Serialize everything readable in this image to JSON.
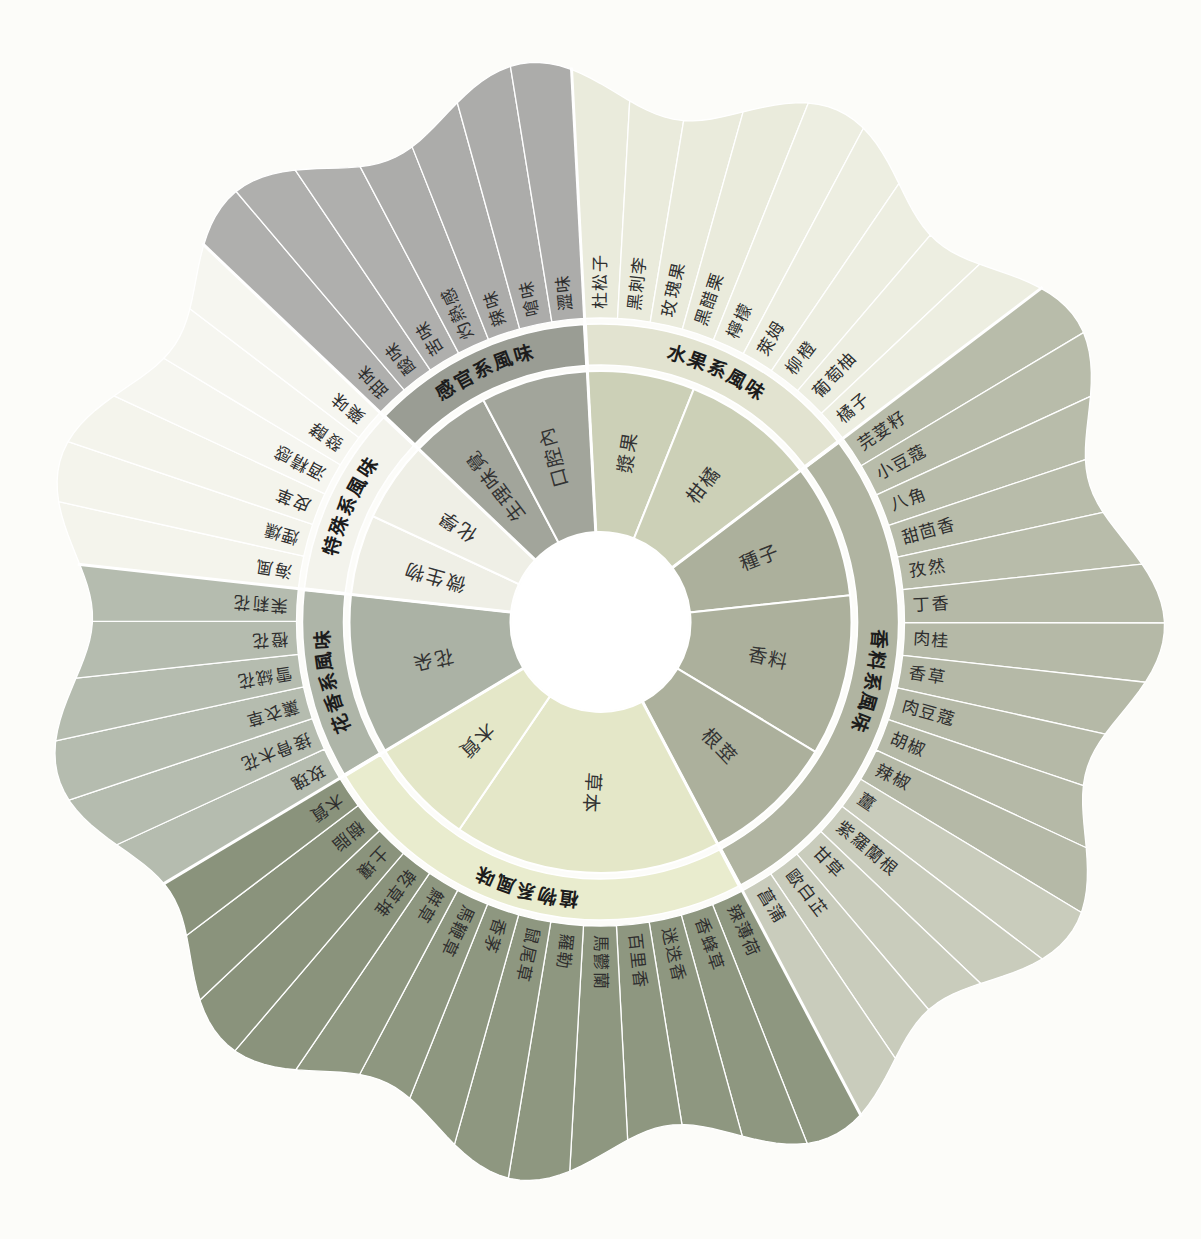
{
  "chart_data": {
    "type": "sunburst",
    "title": "",
    "legend": "none",
    "grid": false,
    "rings": 3,
    "sections": [
      {
        "label": "水果系風味",
        "band_color": "#e2e3d0",
        "inner_color": "#ccd0b7",
        "subcategories": [
          {
            "label": "漿果",
            "item_color": "#eaebdc",
            "items": [
              "杜松子",
              "黑刺李",
              "玫瑰果",
              "黑醋栗"
            ]
          },
          {
            "label": "柑橘",
            "item_color": "#edeee1",
            "items": [
              "檸檬",
              "萊姆",
              "柳橙",
              "葡萄柚",
              "橘子"
            ]
          }
        ]
      },
      {
        "label": "香料系風味",
        "band_color": "#b0b4a1",
        "inner_color": "#acb09c",
        "subcategories": [
          {
            "label": "種子",
            "item_color": "#b8bcaa",
            "items": [
              "芫荽籽",
              "小豆蔻",
              "八角",
              "甜茴香",
              "孜然"
            ]
          },
          {
            "label": "香料",
            "item_color": "#b5b9a7",
            "items": [
              "丁香",
              "肉桂",
              "香草",
              "肉豆蔻",
              "胡椒",
              "辣椒"
            ]
          },
          {
            "label": "根莖",
            "item_color": "#c9ccbc",
            "items": [
              "薑",
              "紫羅蘭根",
              "甘草",
              "歐白芷",
              "菖蒲"
            ]
          }
        ]
      },
      {
        "label": "植物系風味",
        "band_color": "#e9ecce",
        "inner_color": "#e4e7c8",
        "subcategories": [
          {
            "label": "草本",
            "item_color": "#8e9780",
            "items": [
              "辣薄荷",
              "香蜂草",
              "迷迭香",
              "百里香",
              "馬鬱蘭",
              "羅勒",
              "鼠尾草",
              "香茅",
              "馬鞭草",
              "鮮草"
            ]
          },
          {
            "label": "木質",
            "item_color": "#8a937c",
            "items": [
              "乾草堆",
              "土壤",
              "樹脂",
              "木質"
            ]
          }
        ]
      },
      {
        "label": "花香系風味",
        "band_color": "#aeb5a8",
        "inner_color": "#abb2a5",
        "subcategories": [
          {
            "label": "花朵",
            "item_color": "#b5bcaf",
            "items": [
              "玫瑰",
              "接骨木花",
              "薰衣草",
              "雪絨花",
              "橙花",
              "茉莉花"
            ]
          }
        ]
      },
      {
        "label": "特殊系風味",
        "band_color": "#f3f3ec",
        "inner_color": "#efefe6",
        "subcategories": [
          {
            "label": "微生物",
            "item_color": "#f4f4ec",
            "items": [
              "海風",
              "煙燻",
              "皮革"
            ]
          },
          {
            "label": "化學",
            "item_color": "#f6f6f0",
            "items": [
              "酒精感",
              "發酵",
              "藥味"
            ]
          }
        ]
      },
      {
        "label": "感官系風味",
        "band_color": "#9a9d94",
        "inner_color": "#a2a59b",
        "subcategories": [
          {
            "label": "生理味覺",
            "item_color": "#afafad",
            "items": [
              "甜味",
              "酸味",
              "苦味"
            ]
          },
          {
            "label": "口腔內",
            "item_color": "#acacaa",
            "items": [
              "灼熱感",
              "辣味",
              "嗆味",
              "澀味"
            ]
          }
        ]
      }
    ],
    "colors": {
      "background": "#fcfcf9",
      "divider": "#ffffff",
      "center": "#ffffff",
      "item_text": "#2e2e2e",
      "section_text": "#1c1c1c"
    }
  }
}
